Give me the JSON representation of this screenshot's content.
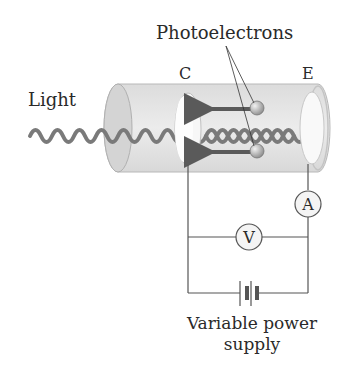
{
  "diagram": {
    "labels": {
      "photoelectrons": "Photoelectrons",
      "light": "Light",
      "cathode": "C",
      "emitter": "E",
      "ammeter": "A",
      "voltmeter": "V",
      "power_supply_line1": "Variable power",
      "power_supply_line2": "supply"
    },
    "colors": {
      "tube_fill": "#e6e6e6",
      "tube_edge": "#b8b8b8",
      "wave": "#7a7a7a",
      "arrow": "#5a5a5a",
      "electron": "#a8a8a8",
      "wire": "#555555",
      "text": "#2a2a2a"
    }
  }
}
